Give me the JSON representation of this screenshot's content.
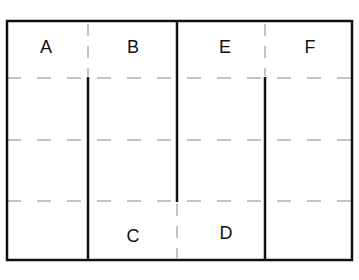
{
  "diagram": {
    "type": "floor-plan / partition layout",
    "colors": {
      "wall": "#111111",
      "dashed": "#b0b0b0",
      "background": "#ffffff"
    },
    "regions": [
      {
        "id": "A",
        "label": "A",
        "x": 46,
        "y": 47
      },
      {
        "id": "B",
        "label": "B",
        "x": 133,
        "y": 47
      },
      {
        "id": "E",
        "label": "E",
        "x": 225,
        "y": 47
      },
      {
        "id": "F",
        "label": "F",
        "x": 310,
        "y": 47
      },
      {
        "id": "C",
        "label": "C",
        "x": 133,
        "y": 236
      },
      {
        "id": "D",
        "label": "D",
        "x": 226,
        "y": 233
      }
    ]
  }
}
